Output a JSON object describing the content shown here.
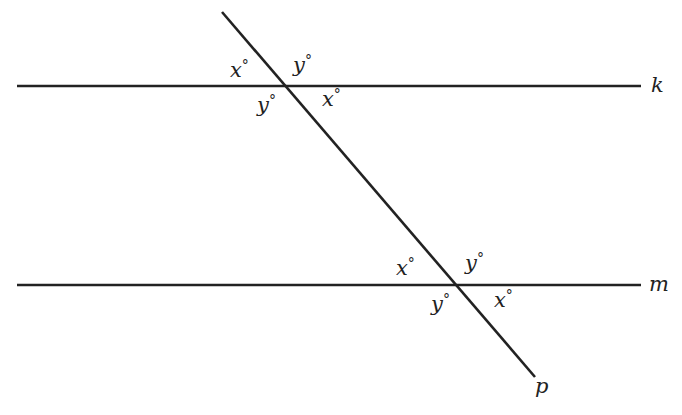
{
  "diagram": {
    "lines": [
      {
        "name": "k",
        "x1": 17,
        "y1": 86,
        "x2": 641,
        "y2": 86,
        "label": "k",
        "label_x": 651,
        "label_y": 92
      },
      {
        "name": "m",
        "x1": 17,
        "y1": 285,
        "x2": 641,
        "y2": 285,
        "label": "m",
        "label_x": 649,
        "label_y": 291
      },
      {
        "name": "p",
        "x1": 222,
        "y1": 12,
        "x2": 535,
        "y2": 377,
        "label": "p",
        "label_x": 535,
        "label_y": 393
      }
    ],
    "stroke_color": "#222222",
    "angle_labels": [
      {
        "var": "x",
        "deg": "°",
        "x": 230,
        "y": 77
      },
      {
        "var": "y",
        "deg": "°",
        "x": 293,
        "y": 72
      },
      {
        "var": "y",
        "deg": "°",
        "x": 257,
        "y": 112
      },
      {
        "var": "x",
        "deg": "°",
        "x": 322,
        "y": 106
      },
      {
        "var": "x",
        "deg": "°",
        "x": 396,
        "y": 275
      },
      {
        "var": "y",
        "deg": "°",
        "x": 465,
        "y": 270
      },
      {
        "var": "y",
        "deg": "°",
        "x": 431,
        "y": 311
      },
      {
        "var": "x",
        "deg": "°",
        "x": 494,
        "y": 307
      }
    ]
  }
}
